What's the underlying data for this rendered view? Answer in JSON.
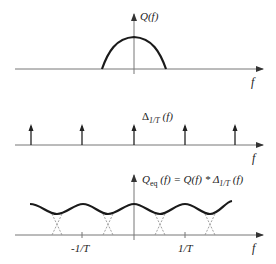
{
  "figure": {
    "panels": [
      {
        "id": "top",
        "ylabel": "Q(f)",
        "xlabel": "f",
        "description": "Spectrum Q(f): single bell-shaped lobe centered at f=0, bandwidth slightly exceeding 1/T"
      },
      {
        "id": "middle",
        "ylabel_main": "Δ",
        "ylabel_sub": "1/T",
        "ylabel_tail": " (f)",
        "xlabel": "f",
        "impulse_count": 5,
        "description": "Impulse train spaced 1/T apart"
      },
      {
        "id": "bottom",
        "ylabel_q": "Q",
        "ylabel_eq_sub": "eq",
        "ylabel_mid": " (f) = Q(f) * Δ",
        "ylabel_delta_sub": "1/T",
        "ylabel_tail": " (f)",
        "xlabel": "f",
        "ticks": [
          "-1/T",
          "1/T"
        ],
        "description": "Periodic repetition of Q(f); overlapping tails shown dashed"
      }
    ],
    "colors": {
      "curve": "#1a1a1a",
      "axis": "#777777",
      "dashed": "#888888",
      "text": "#222222"
    }
  }
}
